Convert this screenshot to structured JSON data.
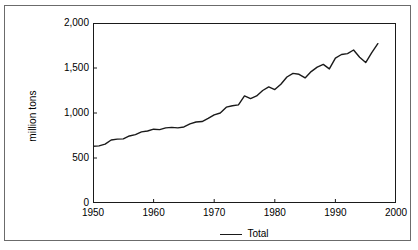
{
  "chart_data": {
    "type": "line",
    "title": "",
    "xlabel": "",
    "ylabel": "million tons",
    "xlim": [
      1950,
      2000
    ],
    "ylim": [
      0,
      2000
    ],
    "grid": false,
    "legend_position": "bottom-center",
    "x_ticks": [
      "1950",
      "1960",
      "1970",
      "1980",
      "1990",
      "2000"
    ],
    "x_tick_values": [
      1950,
      1960,
      1970,
      1980,
      1990,
      2000
    ],
    "y_ticks": [
      "0",
      "500",
      "1,000",
      "1,500",
      "2,000"
    ],
    "y_tick_values": [
      0,
      500,
      1000,
      1500,
      2000
    ],
    "series": [
      {
        "name": "Total",
        "color": "#1a1a1a",
        "x": [
          1950,
          1951,
          1952,
          1953,
          1954,
          1955,
          1956,
          1957,
          1958,
          1959,
          1960,
          1961,
          1962,
          1963,
          1964,
          1965,
          1966,
          1967,
          1968,
          1969,
          1970,
          1971,
          1972,
          1973,
          1974,
          1975,
          1976,
          1977,
          1978,
          1979,
          1980,
          1981,
          1982,
          1983,
          1984,
          1985,
          1986,
          1987,
          1988,
          1989,
          1990,
          1991,
          1992,
          1993,
          1994,
          1995,
          1996,
          1997
        ],
        "values": [
          630,
          635,
          655,
          700,
          710,
          712,
          745,
          760,
          790,
          800,
          820,
          815,
          835,
          840,
          835,
          845,
          880,
          900,
          905,
          940,
          980,
          1000,
          1065,
          1080,
          1090,
          1190,
          1160,
          1190,
          1250,
          1290,
          1260,
          1320,
          1400,
          1440,
          1430,
          1390,
          1460,
          1510,
          1540,
          1490,
          1610,
          1650,
          1660,
          1700,
          1620,
          1560,
          1670,
          1770
        ]
      }
    ]
  },
  "axes": {
    "y_label": "million tons"
  },
  "legend": {
    "entries": [
      {
        "label": "Total",
        "marker": "line",
        "color": "#1a1a1a"
      }
    ]
  }
}
